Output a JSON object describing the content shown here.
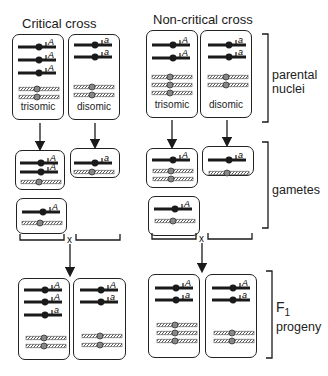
{
  "titles": {
    "critical": "Critical cross",
    "noncritical": "Non-critical cross"
  },
  "side_labels": {
    "parental": [
      "parental",
      "nuclei"
    ],
    "gametes": "gametes",
    "f1": [
      "F",
      "1",
      "progeny"
    ]
  },
  "nucleus_labels": {
    "trisomic": "trisomic",
    "disomic": "disomic"
  },
  "cross_symbol": "x",
  "allele_labels": {
    "dominant": "A",
    "recessive": "a"
  },
  "colors": {
    "line": "#1a1a1a",
    "hatched": "#555555",
    "background": "#ffffff"
  },
  "stages": [
    {
      "name": "parental nuclei",
      "critical": [
        {
          "type": "trisomic",
          "marked": [
            "A",
            "A",
            "A"
          ],
          "unmarked": 2
        },
        {
          "type": "disomic",
          "marked": [
            "a",
            "a"
          ],
          "unmarked": 2
        }
      ],
      "noncritical": [
        {
          "type": "trisomic",
          "marked": [
            "A",
            "A"
          ],
          "unmarked": 3
        },
        {
          "type": "disomic",
          "marked": [
            "a",
            "a"
          ],
          "unmarked": 2
        }
      ]
    },
    {
      "name": "gametes",
      "critical": [
        {
          "marked": [
            "A",
            "A"
          ],
          "unmarked": 1
        },
        {
          "marked": [
            "a"
          ],
          "unmarked": 1
        },
        {
          "marked": [
            "A"
          ],
          "unmarked": 1
        }
      ],
      "noncritical": [
        {
          "marked": [
            "A"
          ],
          "unmarked": 2
        },
        {
          "marked": [
            "a"
          ],
          "unmarked": 1
        },
        {
          "marked": [
            "A"
          ],
          "unmarked": 1
        }
      ]
    },
    {
      "name": "F1 progeny",
      "critical": [
        {
          "marked": [
            "A",
            "A",
            "a"
          ],
          "unmarked": 2
        },
        {
          "marked": [
            "A",
            "a"
          ],
          "unmarked": 2
        }
      ],
      "noncritical": [
        {
          "marked": [
            "A",
            "a"
          ],
          "unmarked": 3
        },
        {
          "marked": [
            "A",
            "a"
          ],
          "unmarked": 2
        }
      ]
    }
  ]
}
